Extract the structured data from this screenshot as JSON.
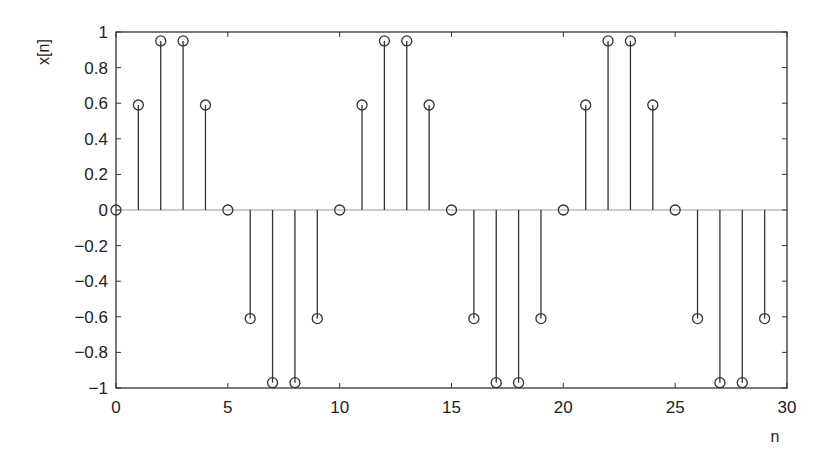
{
  "chart_data": {
    "type": "stem",
    "title": "",
    "xlabel": "n",
    "ylabel": "x[n]",
    "xlim": [
      0,
      30
    ],
    "ylim": [
      -1,
      1
    ],
    "grid": false,
    "legend": null,
    "x_ticks": [
      0,
      5,
      10,
      15,
      20,
      25,
      30
    ],
    "x_tick_labels": [
      "0",
      "5",
      "10",
      "15",
      "20",
      "25",
      "30"
    ],
    "y_ticks": [
      1,
      0.8,
      0.6,
      0.4,
      0.2,
      0,
      -0.2,
      -0.4,
      -0.6,
      -0.8,
      -1
    ],
    "y_tick_labels": [
      "1",
      "0.8",
      "0.6",
      "0.4",
      "0.2",
      "0",
      "−0.2",
      "−0.4",
      "−0.6",
      "−0.8",
      "−1"
    ],
    "marker": "open-circle",
    "series": [
      {
        "name": "x[n]",
        "x": [
          0,
          1,
          2,
          3,
          4,
          5,
          6,
          7,
          8,
          9,
          10,
          11,
          12,
          13,
          14,
          15,
          16,
          17,
          18,
          19,
          20,
          21,
          22,
          23,
          24,
          25,
          26,
          27,
          28,
          29
        ],
        "values": [
          0,
          0.59,
          0.95,
          0.95,
          0.59,
          0,
          -0.61,
          -0.97,
          -0.97,
          -0.61,
          0,
          0.59,
          0.95,
          0.95,
          0.59,
          0,
          -0.61,
          -0.97,
          -0.97,
          -0.61,
          0,
          0.59,
          0.95,
          0.95,
          0.59,
          0,
          -0.61,
          -0.97,
          -0.97,
          -0.61
        ]
      }
    ]
  },
  "colors": {
    "axis": "#333333",
    "stem": "#333333",
    "baseline": "#999999",
    "background": "#ffffff"
  }
}
